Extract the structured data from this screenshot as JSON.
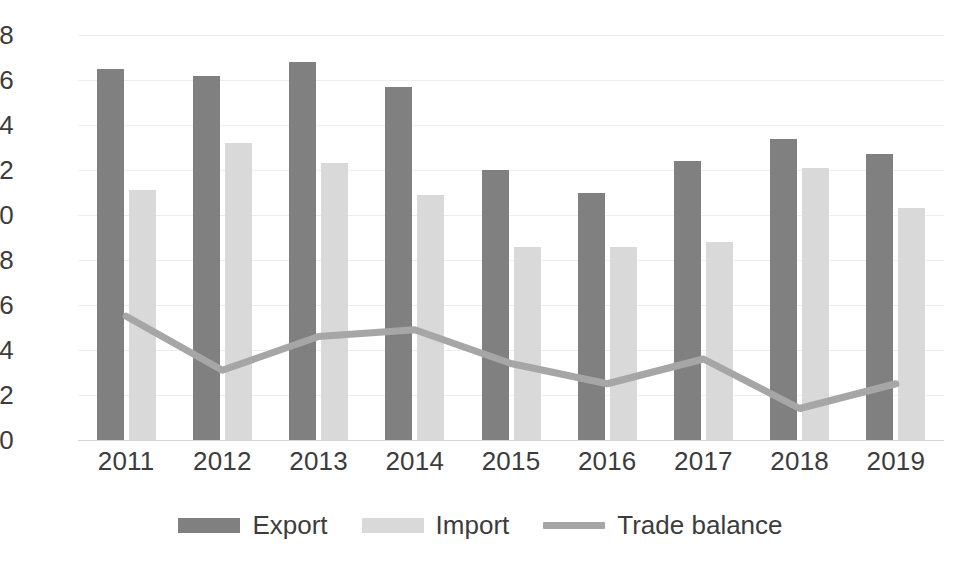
{
  "chart_data": {
    "type": "bar",
    "title": "",
    "subtitle": "",
    "xlabel": "",
    "ylabel": "",
    "categories": [
      "2011",
      "2012",
      "2013",
      "2014",
      "2015",
      "2016",
      "2017",
      "2018",
      "2019"
    ],
    "ylim": [
      0,
      18
    ],
    "ytick_labels": [
      "18",
      "16",
      "14",
      "12",
      "10",
      "8",
      "6",
      "4",
      "2",
      "0"
    ],
    "yticks": [
      18,
      16,
      14,
      12,
      10,
      8,
      6,
      4,
      2,
      0
    ],
    "grid": true,
    "grid_axis": "y",
    "legend_position": "bottom",
    "series": [
      {
        "name": "Export",
        "type": "bar",
        "color": "#808080",
        "values": [
          16.5,
          16.2,
          16.8,
          15.7,
          12.0,
          11.0,
          12.4,
          13.4,
          12.7
        ]
      },
      {
        "name": "Import",
        "type": "bar",
        "color": "#d9d9d9",
        "values": [
          11.1,
          13.2,
          12.3,
          10.9,
          8.6,
          8.6,
          8.8,
          12.1,
          10.3
        ]
      },
      {
        "name": "Trade balance",
        "type": "line",
        "color": "#a6a6a6",
        "values": [
          5.5,
          3.1,
          4.6,
          4.9,
          3.4,
          2.5,
          3.6,
          1.4,
          2.5
        ]
      }
    ]
  },
  "legend": {
    "items": [
      {
        "label": "Export",
        "swatch": "bar-swatch-export"
      },
      {
        "label": "Import",
        "swatch": "bar-swatch-import"
      },
      {
        "label": "Trade balance",
        "swatch": "line-swatch-trade-balance"
      }
    ]
  }
}
